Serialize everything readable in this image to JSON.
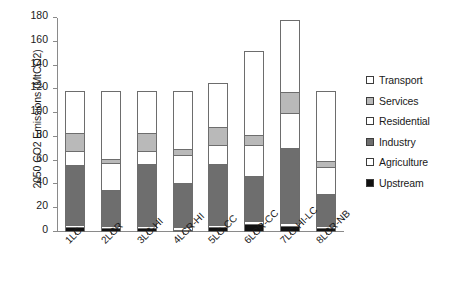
{
  "chart_data": {
    "type": "bar",
    "subtype": "stacked-vertical",
    "title": "",
    "xlabel": "",
    "ylabel": "2050 CO2 Emissions (MtCO2)",
    "ylim": [
      0,
      180
    ],
    "ytick_step": 20,
    "yticks": [
      180,
      160,
      140,
      120,
      100,
      80,
      60,
      40,
      20,
      0
    ],
    "grid": false,
    "legend_position": "right",
    "categories": [
      "1LC",
      "2LCR",
      "3LC-HI",
      "4LCR-HI",
      "5LC-CC",
      "6LCR-CC",
      "7LC-HI-LC",
      "8LCR-NB"
    ],
    "stack_order_bottom_to_top": [
      "Upstream",
      "Agriculture",
      "Industry",
      "Residential",
      "Services",
      "Transport"
    ],
    "series": [
      {
        "name": "Upstream",
        "color": "#111111",
        "values": [
          4,
          3,
          3,
          2,
          4,
          7,
          5,
          3
        ]
      },
      {
        "name": "Agriculture",
        "color": "#ffffff",
        "values": [
          2,
          2,
          2,
          2,
          2,
          2,
          3,
          2
        ]
      },
      {
        "name": "Industry",
        "color": "#6e6e6e",
        "values": [
          50,
          30,
          52,
          37,
          51,
          38,
          63,
          27
        ]
      },
      {
        "name": "Residential",
        "color": "#ffffff",
        "values": [
          12,
          23,
          11,
          24,
          16,
          26,
          29,
          23
        ]
      },
      {
        "name": "Services",
        "color": "#b9b9b9",
        "values": [
          15,
          3,
          15,
          5,
          15,
          9,
          18,
          5
        ]
      },
      {
        "name": "Transport",
        "color": "#ffffff",
        "values": [
          36,
          58,
          36,
          49,
          37,
          70,
          60,
          59
        ]
      }
    ],
    "totals": [
      119,
      119,
      119,
      119,
      125,
      152,
      178,
      119
    ]
  },
  "legend": {
    "items": [
      {
        "label": "Transport",
        "color": "#ffffff"
      },
      {
        "label": "Services",
        "color": "#b9b9b9"
      },
      {
        "label": "Residential",
        "color": "#ffffff"
      },
      {
        "label": "Industry",
        "color": "#6e6e6e"
      },
      {
        "label": "Agriculture",
        "color": "#ffffff"
      },
      {
        "label": "Upstream",
        "color": "#111111"
      }
    ]
  }
}
